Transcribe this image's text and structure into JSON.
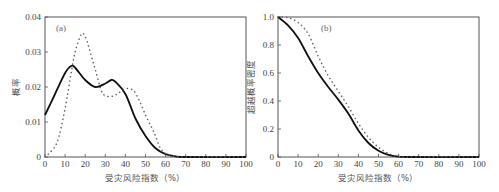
{
  "chart_data": [
    {
      "panel": "(a)",
      "type": "line",
      "title": "",
      "xlabel": "受灾风险指数（%）",
      "ylabel": "概率",
      "xlim": [
        0,
        100
      ],
      "ylim": [
        0,
        0.04
      ],
      "xticks": [
        "0",
        "10",
        "20",
        "30",
        "40",
        "50",
        "60",
        "70",
        "80",
        "90",
        "100"
      ],
      "yticks": [
        "0",
        "0.01",
        "0.02",
        "0.03",
        "0.04"
      ],
      "grid": false,
      "legend": null,
      "series": [
        {
          "name": "solid",
          "style": "solid",
          "color": "#111111",
          "x": [
            0,
            5,
            10,
            13,
            15,
            20,
            25,
            30,
            33,
            35,
            40,
            45,
            50,
            55,
            60,
            65,
            70,
            100
          ],
          "values": [
            0.012,
            0.018,
            0.024,
            0.026,
            0.0255,
            0.022,
            0.02,
            0.021,
            0.022,
            0.0215,
            0.018,
            0.011,
            0.006,
            0.0025,
            0.0008,
            0.0002,
            0,
            0
          ]
        },
        {
          "name": "dotted",
          "style": "dotted",
          "color": "#666666",
          "x": [
            0,
            2,
            5,
            7,
            9,
            11,
            13,
            15,
            18,
            20,
            22,
            25,
            28,
            30,
            33,
            36,
            40,
            44,
            47,
            50,
            53,
            55,
            57,
            60,
            65,
            70,
            100
          ],
          "values": [
            0,
            0.001,
            0.003,
            0.006,
            0.011,
            0.017,
            0.024,
            0.03,
            0.035,
            0.0345,
            0.031,
            0.025,
            0.019,
            0.0175,
            0.0173,
            0.018,
            0.0195,
            0.019,
            0.016,
            0.012,
            0.0085,
            0.006,
            0.003,
            0.001,
            0.0002,
            0,
            0
          ]
        }
      ]
    },
    {
      "panel": "(b)",
      "type": "line",
      "title": "",
      "xlabel": "受灾风险指数（%）",
      "ylabel": "超越概率密度",
      "xlim": [
        0,
        100
      ],
      "ylim": [
        0,
        1.0
      ],
      "xticks": [
        "0",
        "10",
        "20",
        "30",
        "40",
        "50",
        "60",
        "70",
        "80",
        "90",
        "100"
      ],
      "yticks": [
        "0",
        "0.2",
        "0.4",
        "0.6",
        "0.8",
        "1.0"
      ],
      "grid": false,
      "legend": null,
      "series": [
        {
          "name": "solid",
          "style": "solid",
          "color": "#111111",
          "x": [
            0,
            5,
            10,
            15,
            20,
            25,
            30,
            35,
            40,
            45,
            50,
            55,
            60,
            65,
            100
          ],
          "values": [
            1.0,
            0.94,
            0.85,
            0.72,
            0.6,
            0.5,
            0.41,
            0.31,
            0.19,
            0.1,
            0.045,
            0.015,
            0.003,
            0,
            0
          ]
        },
        {
          "name": "dotted",
          "style": "dotted",
          "color": "#666666",
          "x": [
            0,
            5,
            10,
            15,
            20,
            25,
            30,
            35,
            40,
            45,
            50,
            55,
            60,
            65,
            100
          ],
          "values": [
            1.0,
            0.995,
            0.96,
            0.88,
            0.72,
            0.58,
            0.47,
            0.36,
            0.24,
            0.14,
            0.07,
            0.025,
            0.005,
            0,
            0
          ]
        }
      ]
    }
  ],
  "panels": {
    "a": {
      "label": "(a)",
      "ylabel": "概率",
      "xlabel": "受灾风险指数（%）"
    },
    "b": {
      "label": "(b)",
      "ylabel": "超越概率密度",
      "xlabel": "受灾风险指数（%）"
    }
  }
}
